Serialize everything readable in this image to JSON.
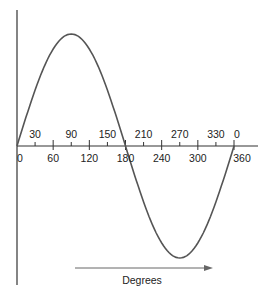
{
  "chart_data": {
    "type": "line",
    "title": "",
    "xlabel": "Degrees",
    "ylabel": "",
    "function": "sine",
    "xlim": [
      0,
      360
    ],
    "ylim": [
      -1,
      1
    ],
    "x": [
      0,
      30,
      60,
      90,
      120,
      150,
      180,
      210,
      240,
      270,
      300,
      330,
      360
    ],
    "values": [
      0,
      0.5,
      0.866,
      1,
      0.866,
      0.5,
      0,
      -0.5,
      -0.866,
      -1,
      -0.866,
      -0.5,
      0
    ],
    "upper_tick_labels": [
      "30",
      "90",
      "150",
      "210",
      "270",
      "330",
      "0"
    ],
    "lower_tick_labels": [
      "0",
      "60",
      "120",
      "180",
      "240",
      "300",
      "360"
    ],
    "grid": false,
    "legend": null
  },
  "labels": {
    "upper": [
      {
        "text": "30",
        "deg": 30
      },
      {
        "text": "90",
        "deg": 90
      },
      {
        "text": "150",
        "deg": 150
      },
      {
        "text": "210",
        "deg": 210
      },
      {
        "text": "270",
        "deg": 270
      },
      {
        "text": "330",
        "deg": 330
      },
      {
        "text": "0",
        "deg": 360
      }
    ],
    "lower": [
      {
        "text": "0",
        "deg": 0
      },
      {
        "text": "60",
        "deg": 60
      },
      {
        "text": "120",
        "deg": 120
      },
      {
        "text": "180",
        "deg": 180
      },
      {
        "text": "240",
        "deg": 240
      },
      {
        "text": "300",
        "deg": 300
      },
      {
        "text": "360",
        "deg": 360
      }
    ],
    "axis_title": "Degrees"
  },
  "colors": {
    "curve": "#555555",
    "axis": "#333333",
    "arrow": "#666666"
  }
}
